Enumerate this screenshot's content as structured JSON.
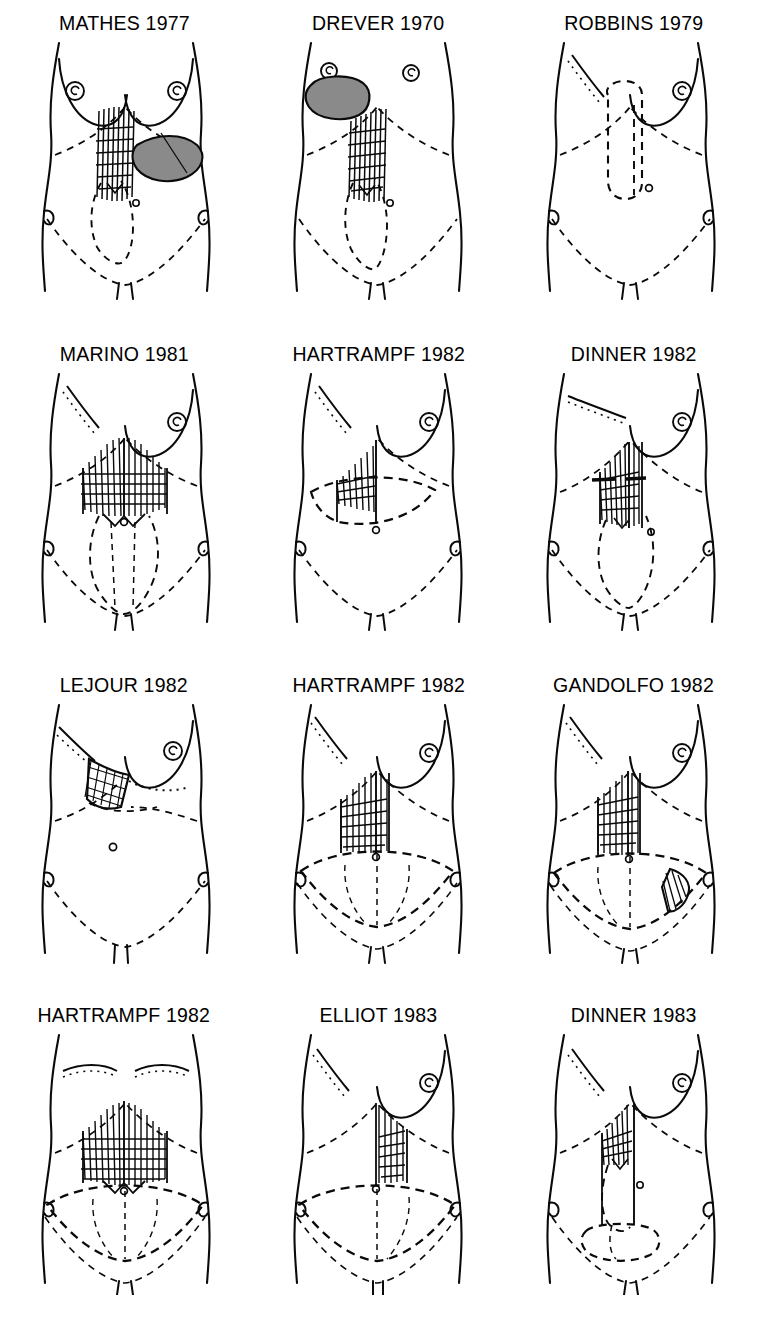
{
  "figure": {
    "columns": 3,
    "rows": 4,
    "ink_color": "#0a0a0a",
    "shade_color": "#7d7d7d",
    "background": "#ffffff"
  },
  "panels": [
    {
      "id": "mathes-1977",
      "label": "MATHES 1977",
      "row": 1,
      "col": 1,
      "breasts": "both",
      "mastectomy_scar": "none",
      "flap": "vertical hatched rectus strip, left paramedian",
      "extra": "shaded leaf-shaped transverse skin island to the right",
      "shaded_island": true
    },
    {
      "id": "drever-1970",
      "label": "DREVER 1970",
      "row": 1,
      "col": 2,
      "breasts": "right-only",
      "mastectomy_scar": "none",
      "flap": "vertical hatched rectus strip",
      "extra": "shaded oval skin island on left chest wall",
      "shaded_island": true
    },
    {
      "id": "robbins-1979",
      "label": "ROBBINS 1979",
      "row": 1,
      "col": 3,
      "breasts": "right-only",
      "mastectomy_scar": "oblique dotted left chest",
      "flap": "long vertical dashed flap outline, no hatching",
      "extra": "",
      "shaded_island": false
    },
    {
      "id": "marino-1981",
      "label": "MARINO 1981",
      "row": 2,
      "col": 1,
      "breasts": "right-only",
      "mastectomy_scar": "oblique dotted left chest",
      "flap": "broad bilateral hatched flap with chevron lower border",
      "extra": "vertical elliptical donor outline below umbilicus",
      "shaded_island": false
    },
    {
      "id": "hartrampf-1982-a",
      "label": "HARTRAMPF 1982",
      "row": 2,
      "col": 2,
      "breasts": "right-only",
      "mastectomy_scar": "oblique dotted left chest",
      "flap": "triangular hatched flap above a transverse lens-shaped island",
      "extra": "horizontal lens donor ellipse at umbilicus level",
      "shaded_island": false
    },
    {
      "id": "dinner-1982",
      "label": "DINNER 1982",
      "row": 2,
      "col": 3,
      "breasts": "right-only",
      "mastectomy_scar": "oblique dotted left chest",
      "flap": "narrow vertical hatched strip with two solid transverse bars",
      "extra": "vertical elliptical donor outline",
      "shaded_island": false
    },
    {
      "id": "lejour-1982",
      "label": "LEJOUR 1982",
      "row": 3,
      "col": 1,
      "breasts": "right-only",
      "mastectomy_scar": "oblique dotted left chest",
      "flap": "cross-hatched oblique epigastric flap",
      "extra": "dotted inframammary line, no lower abdominal donor",
      "shaded_island": false
    },
    {
      "id": "hartrampf-1982-b",
      "label": "HARTRAMPF 1982",
      "row": 3,
      "col": 2,
      "breasts": "right-only",
      "mastectomy_scar": "oblique dotted left chest",
      "flap": "rectangular vertical hatched flap",
      "extra": "wide low transverse abdominoplasty ellipse",
      "shaded_island": false
    },
    {
      "id": "gandolfo-1982",
      "label": "GANDOLFO 1982",
      "row": 3,
      "col": 3,
      "breasts": "right-only",
      "mastectomy_scar": "oblique dotted left chest",
      "flap": "vertical hatched flap plus hatched triangular patch right lower quadrant",
      "extra": "wide low transverse ellipse",
      "shaded_island": false
    },
    {
      "id": "hartrampf-1982-c",
      "label": "HARTRAMPF 1982",
      "row": 4,
      "col": 1,
      "breasts": "none",
      "mastectomy_scar": "bilateral dotted transverse scars",
      "flap": "broad bilateral hatched flap, chevron lower border",
      "extra": "wide low transverse ellipse",
      "shaded_island": false
    },
    {
      "id": "elliot-1983",
      "label": "ELLIOT 1983",
      "row": 4,
      "col": 2,
      "breasts": "right-only",
      "mastectomy_scar": "oblique dotted left chest",
      "flap": "vertical hatched flap column right of midline",
      "extra": "wide low transverse ellipse",
      "shaded_island": false
    },
    {
      "id": "dinner-1983",
      "label": "DINNER 1983",
      "row": 4,
      "col": 3,
      "breasts": "right-only",
      "mastectomy_scar": "oblique dotted left chest",
      "flap": "long vertical hatched strip to low transverse paddle",
      "extra": "low transverse dashed paddle outline",
      "shaded_island": false
    }
  ]
}
